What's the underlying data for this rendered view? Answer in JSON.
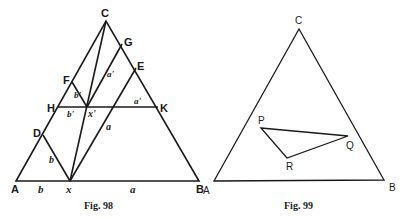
{
  "figures": [
    {
      "caption": "Fig. 98",
      "points": {
        "A": "A",
        "B": "B",
        "C": "C",
        "D": "D",
        "E": "E",
        "F": "F",
        "G": "G",
        "H": "H",
        "K": "K",
        "x": "x",
        "x_prime": "x'"
      },
      "segment_labels": {
        "b_base": "b",
        "a_base": "a",
        "b_Dx": "b",
        "a_xE": "a",
        "b_prime_Fx": "b'",
        "b_prime_Hx": "b'",
        "a_prime_xG": "a'",
        "a_prime_K": "a'"
      }
    },
    {
      "caption": "Fig. 99",
      "points": {
        "A": "A",
        "B": "B",
        "C": "C",
        "P": "P",
        "Q": "Q",
        "R": "R"
      }
    }
  ],
  "colors": {
    "ink": "#1a1a1a",
    "background": "#ffffff"
  }
}
